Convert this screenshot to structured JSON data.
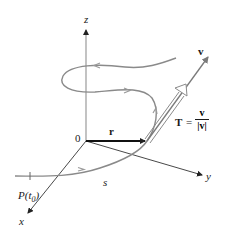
{
  "figure": {
    "type": "3D vector diagram: unit tangent vector of a space curve",
    "axes": {
      "x_label": "x",
      "y_label": "y",
      "z_label": "z",
      "origin_label": "0"
    },
    "vectors": {
      "position_label": "r",
      "velocity_label": "v",
      "tangent_label": "T",
      "tangent_equals": "=",
      "tangent_numerator": "v",
      "tangent_denominator": "|v|"
    },
    "curve": {
      "start_point_label": "P(t",
      "start_point_subscript": "0",
      "start_point_close": ")",
      "arc_length_label": "s"
    },
    "colors": {
      "axis": "#333333",
      "curve": "#8a8a8a",
      "position_vector": "#111111",
      "velocity_vector": "#7a7a7a",
      "tangent_outline": "#8a8a8a",
      "z_axis": "#9a9a9a"
    }
  }
}
